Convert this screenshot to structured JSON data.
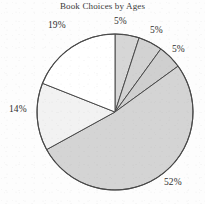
{
  "chart_data": {
    "type": "pie",
    "title": "Book Choices by Ages",
    "xlabel": "",
    "ylabel": "",
    "legend": "none",
    "grid": false,
    "start_angle_deg": 90,
    "direction": "clockwise",
    "labels_position": "outside",
    "categories": [
      "5%",
      "5%",
      "5%",
      "52%",
      "14%",
      "19%"
    ],
    "values": [
      5,
      5,
      5,
      52,
      14,
      19
    ],
    "data_labels": [
      "5%",
      "5%",
      "5%",
      "52%",
      "14%",
      "19%"
    ],
    "slice_colors": [
      "#d6d6d6",
      "#d2d2d2",
      "#cfcfcf",
      "#d4d4d4",
      "#f2f2f2",
      "#ffffff"
    ],
    "outline_color": "#4a4a4a",
    "total": 100
  },
  "chart": {
    "title": "Book Choices by Ages",
    "labels": {
      "slice_1": "5%",
      "slice_2": "5%",
      "slice_3": "5%",
      "slice_4": "52%",
      "slice_5": "14%",
      "slice_6": "19%"
    }
  },
  "colors": {
    "background": "#fdfdfd",
    "outline": "#4a4a4a",
    "text": "#2f2f2f",
    "gray_fill": "#d4d4d4",
    "pale_fill": "#f2f2f2",
    "white_fill": "#ffffff"
  }
}
